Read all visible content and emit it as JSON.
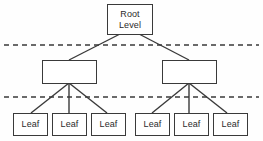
{
  "diagram": {
    "type": "hierarchical-tree",
    "background_color": "#fefefe",
    "stroke_color": "#3a3a3a",
    "text_color": "#2b2b2b",
    "levels": [
      {
        "name": "root",
        "nodes": [
          {
            "id": "root",
            "label_line1": "Root",
            "label_line2": "Level"
          }
        ]
      },
      {
        "name": "intermediate",
        "nodes": [
          {
            "id": "mid-left",
            "label": ""
          },
          {
            "id": "mid-right",
            "label": ""
          }
        ]
      },
      {
        "name": "leaves",
        "nodes": [
          {
            "id": "leaf-1",
            "label": "Leaf"
          },
          {
            "id": "leaf-2",
            "label": "Leaf"
          },
          {
            "id": "leaf-3",
            "label": "Leaf"
          },
          {
            "id": "leaf-4",
            "label": "Leaf"
          },
          {
            "id": "leaf-5",
            "label": "Leaf"
          },
          {
            "id": "leaf-6",
            "label": "Leaf"
          }
        ]
      }
    ],
    "separators": [
      {
        "id": "separator-top",
        "style": "dashed",
        "y": 45
      },
      {
        "id": "separator-bottom",
        "style": "dashed",
        "y": 97
      }
    ]
  }
}
